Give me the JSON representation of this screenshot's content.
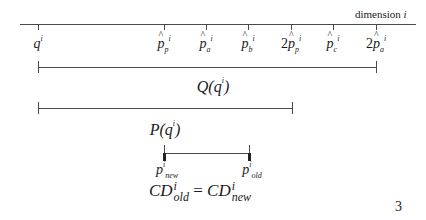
{
  "axis": {
    "label": "dimension",
    "label_var": "i",
    "ticks": [
      {
        "prefix": "",
        "base": "q",
        "hat": false,
        "sub": "",
        "sup": "i",
        "x": 38
      },
      {
        "prefix": "",
        "base": "p",
        "hat": true,
        "sub": "p",
        "sup": "i",
        "x": 164
      },
      {
        "prefix": "",
        "base": "p",
        "hat": true,
        "sub": "a",
        "sup": "i",
        "x": 206
      },
      {
        "prefix": "",
        "base": "p",
        "hat": true,
        "sub": "b",
        "sup": "i",
        "x": 248
      },
      {
        "prefix": "2",
        "base": "p",
        "hat": true,
        "sub": "p",
        "sup": "i",
        "x": 291
      },
      {
        "prefix": "",
        "base": "p",
        "hat": true,
        "sub": "c",
        "sup": "i",
        "x": 333
      },
      {
        "prefix": "2",
        "base": "p",
        "hat": true,
        "sub": "a",
        "sup": "i",
        "x": 376
      }
    ]
  },
  "intervals": {
    "Q": {
      "name": "Q",
      "arg": "q",
      "arg_sup": "i",
      "from": "q^i",
      "to": "2p̂_a^i"
    },
    "P": {
      "name": "P",
      "arg": "q",
      "arg_sup": "i",
      "from": "q^i",
      "to": "2p̂_p^i"
    },
    "price": {
      "left": {
        "base": "p",
        "sub": "new",
        "sup": "i"
      },
      "right": {
        "base": "p",
        "sub": "old",
        "sup": "i"
      }
    }
  },
  "equation": {
    "lhs": {
      "base": "CD",
      "sup": "i",
      "sub": "old"
    },
    "op": "=",
    "rhs": {
      "base": "CD",
      "sup": "i",
      "sub": "new"
    }
  },
  "page_number": "3"
}
